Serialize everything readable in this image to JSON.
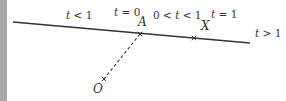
{
  "diagram": {
    "type": "vector-line-parameter",
    "colors": {
      "line": "#333333",
      "text": "#333333",
      "strip": "#a9a9a9"
    },
    "line": {
      "x1": 13,
      "y1": 22,
      "x2": 250,
      "y2": 43
    },
    "dashed_segment": {
      "x1": 140,
      "y1": 34,
      "x2": 104,
      "y2": 79
    },
    "points": [
      {
        "name": "A",
        "x": 140,
        "y": 34,
        "label_x": 138,
        "label_y": 26
      },
      {
        "name": "X",
        "x": 194,
        "y": 38,
        "label_x": 201,
        "label_y": 30
      },
      {
        "name": "O",
        "x": 104,
        "y": 79,
        "label_x": 93,
        "label_y": 93
      }
    ],
    "region_labels": [
      {
        "text_var": "t",
        "text_rest": " < 1",
        "x": 66,
        "y": 19
      },
      {
        "text_var": "t",
        "text_rest": " = 0",
        "x": 114,
        "y": 16
      },
      {
        "text_pre": "0 < ",
        "text_var": "t",
        "text_rest": " < 1",
        "x": 153,
        "y": 19
      },
      {
        "text_var": "t",
        "text_rest": " = 1",
        "x": 211,
        "y": 18
      },
      {
        "text_var": "t",
        "text_rest": " > 1",
        "x": 255,
        "y": 37
      }
    ]
  }
}
